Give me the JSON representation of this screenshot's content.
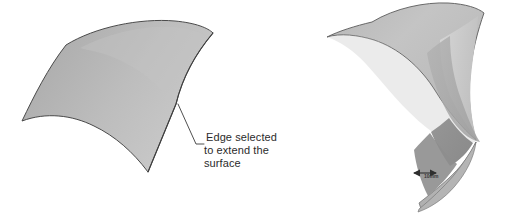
{
  "page": {
    "background_color": "#ffffff",
    "width": 508,
    "height": 214
  },
  "figures": [
    {
      "id": "left-figure",
      "name": "original-surface-figure",
      "description": "Shaded curved surface patch before extension",
      "annotation": {
        "name": "edge-selected-callout",
        "lines": [
          "Edge selected",
          "to extend the",
          "surface"
        ],
        "line1": "Edge selected",
        "line2": "to extend the",
        "line3": "surface",
        "text_color": "#2b2b2b",
        "leader_color": "#3b3b3b"
      },
      "surface": {
        "fill_light": "#c9c9c9",
        "fill_mid": "#b2b2b2",
        "fill_dark": "#9a9a9a",
        "outline_color": "#4a4a4a"
      }
    },
    {
      "id": "right-figure",
      "name": "extended-surface-figure",
      "description": "Same surface after the selected edge has been extended, showing facet bands",
      "dimension": {
        "name": "extension-distance-dimension",
        "value": "10mm",
        "arrow_color": "#2f2f2f",
        "text_color": "#3a3a3a"
      },
      "surface": {
        "fill_light": "#cfcfcf",
        "fill_mid": "#b4b4b4",
        "fill_dark": "#9b9b9b",
        "fill_darkest": "#8a8a8a",
        "outline_color": "#5a5a5a"
      }
    }
  ]
}
